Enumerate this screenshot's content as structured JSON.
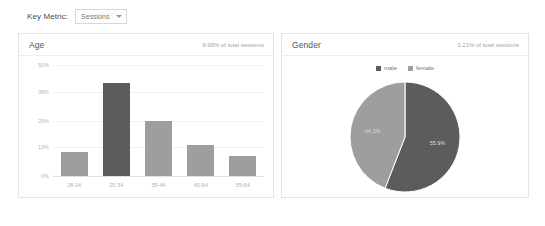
{
  "toolbar": {
    "key_metric_label": "Key Metric:",
    "selected_metric": "Sessions",
    "caret_icon": "chevron-down-icon"
  },
  "panels": {
    "age": {
      "title": "Age",
      "subtitle": "9.98% of total sessions"
    },
    "gender": {
      "title": "Gender",
      "subtitle": "3.21% of total sessions"
    }
  },
  "colors": {
    "bar": "#9e9e9e",
    "bar_accent": "#5c5c5c",
    "male": "#5c5c5c",
    "female": "#9e9e9e",
    "grid": "#f1f1f1",
    "panel_border": "#e4e4e4"
  },
  "chart_data": [
    {
      "type": "bar",
      "title": "Age",
      "xlabel": "",
      "ylabel": "",
      "categories": [
        "18-24",
        "25-34",
        "35-44",
        "45-54",
        "55-64"
      ],
      "values": [
        11.0,
        42.0,
        25.0,
        14.0,
        9.0
      ],
      "highlight_index": 1,
      "yticks": [
        "0%",
        "13%",
        "25%",
        "38%",
        "50%"
      ],
      "ytick_values": [
        0,
        13,
        25,
        38,
        50
      ],
      "ylim": [
        0,
        50
      ],
      "grid": true,
      "legend": "none"
    },
    {
      "type": "pie",
      "title": "Gender",
      "labels": [
        "male",
        "female"
      ],
      "values": [
        55.9,
        44.1
      ],
      "value_labels": [
        "55.9%",
        "44.1%"
      ],
      "legend": "top",
      "start_angle_deg": 0
    }
  ]
}
